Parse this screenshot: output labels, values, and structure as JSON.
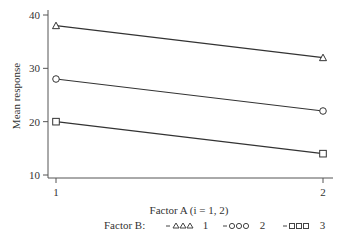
{
  "chart_data": {
    "type": "line",
    "title": "",
    "xlabel": "Factor A (i = 1, 2)",
    "ylabel": "Mean response",
    "x": [
      1,
      2
    ],
    "xticks": [
      "1",
      "2"
    ],
    "yticks": [
      "10",
      "20",
      "30",
      "40"
    ],
    "ylim": [
      10,
      40
    ],
    "grid": false,
    "legend_position": "bottom",
    "legend_title": "Factor B:",
    "series": [
      {
        "name": "1",
        "marker": "triangle",
        "values": [
          38,
          32
        ]
      },
      {
        "name": "2",
        "marker": "circle",
        "values": [
          28,
          22
        ]
      },
      {
        "name": "3",
        "marker": "square",
        "values": [
          20,
          14
        ]
      }
    ],
    "colors": {
      "line": "#333333",
      "axis": "#555555"
    }
  }
}
